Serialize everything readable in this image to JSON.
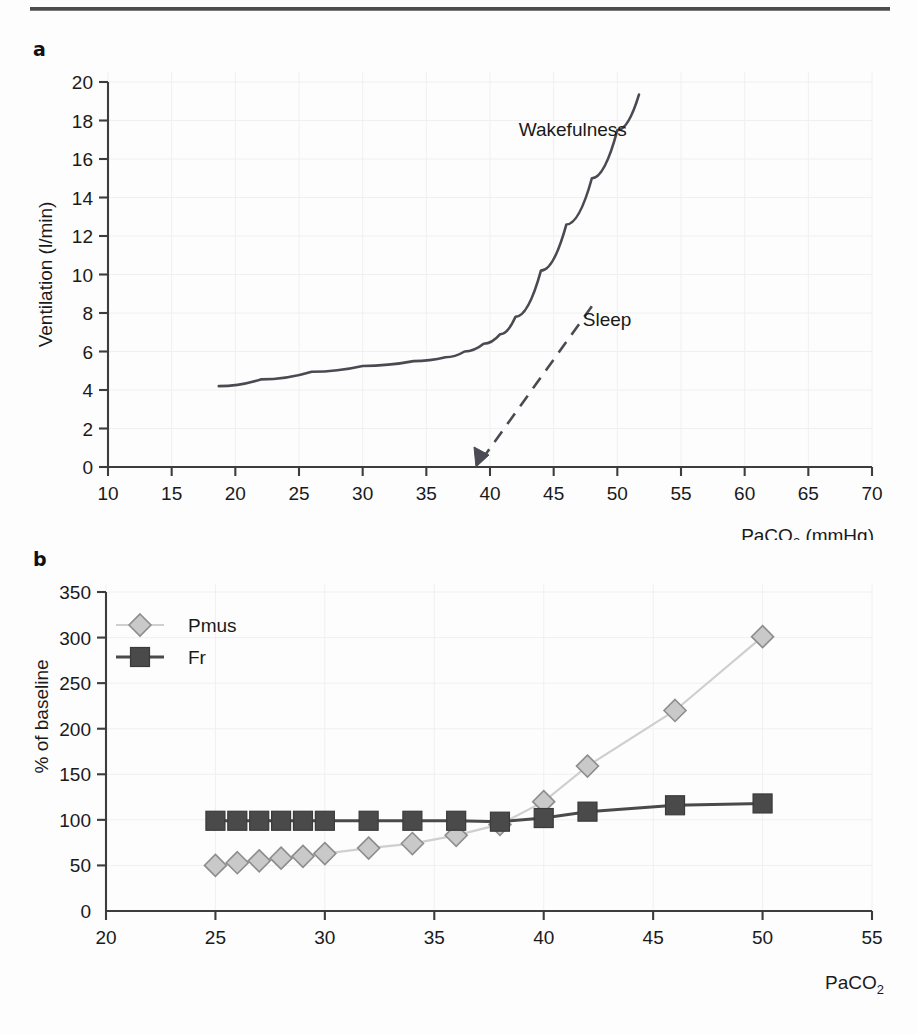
{
  "figure": {
    "panel_a_letter": "a",
    "panel_b_letter": "b"
  },
  "chart_data": [
    {
      "id": "panel_a",
      "type": "line",
      "title": "",
      "xlabel": "PaCO2 (mmHg)",
      "xlabel_main": "PaCO",
      "xlabel_sub": "2",
      "xlabel_unit": " (mmHg)",
      "ylabel": "Ventilation (l/min)",
      "xlim": [
        10,
        70
      ],
      "ylim": [
        0,
        20
      ],
      "xticks": [
        10,
        15,
        20,
        25,
        30,
        35,
        40,
        45,
        50,
        55,
        60,
        65,
        70
      ],
      "yticks": [
        0,
        2,
        4,
        6,
        8,
        10,
        12,
        14,
        16,
        18,
        20
      ],
      "grid": true,
      "legend_position": "inline-annotations",
      "series": [
        {
          "name": "Wakefulness",
          "style": "solid",
          "label_x": 46.5,
          "label_y": 17.2,
          "x": [
            18.7,
            22,
            26,
            30,
            34,
            36.5,
            38,
            39.5,
            40.8,
            42,
            44,
            46,
            48,
            50,
            51.7
          ],
          "y": [
            4.2,
            4.55,
            4.95,
            5.25,
            5.5,
            5.7,
            6.0,
            6.4,
            6.9,
            7.8,
            10.2,
            12.6,
            15.0,
            17.5,
            19.35
          ]
        },
        {
          "name": "Sleep",
          "style": "dashed-with-arrow",
          "label_x": 49.2,
          "label_y": 7.3,
          "x": [
            48.0,
            38.9
          ],
          "y": [
            8.35,
            0.0
          ],
          "arrow_at": {
            "x": 38.9,
            "y": 0.0
          }
        }
      ]
    },
    {
      "id": "panel_b",
      "type": "line",
      "title": "",
      "xlabel": "PaCO2",
      "xlabel_main": "PaCO",
      "xlabel_sub": "2",
      "ylabel": "% of baseline",
      "xlim": [
        20,
        55
      ],
      "ylim": [
        0,
        350
      ],
      "xticks": [
        20,
        25,
        30,
        35,
        40,
        45,
        50,
        55
      ],
      "yticks": [
        0,
        50,
        100,
        150,
        200,
        250,
        300,
        350
      ],
      "grid": true,
      "legend_position": "top-left",
      "series": [
        {
          "name": "Pmus",
          "marker": "diamond",
          "color": "#c9c9c9",
          "x": [
            25,
            26,
            27,
            28,
            29,
            30,
            32,
            34,
            36,
            38,
            40,
            42,
            46,
            50
          ],
          "y": [
            50,
            53,
            55,
            58,
            60,
            63,
            69,
            74,
            83,
            95,
            120,
            159,
            220,
            301
          ]
        },
        {
          "name": "Fr",
          "marker": "square",
          "color": "#4a4a4a",
          "x": [
            25,
            26,
            27,
            28,
            29,
            30,
            32,
            34,
            36,
            38,
            40,
            42,
            46,
            50
          ],
          "y": [
            99,
            99,
            99,
            99,
            99,
            99,
            99,
            99,
            99,
            98,
            102,
            109,
            116,
            118
          ]
        }
      ]
    }
  ],
  "colors": {
    "axis": "#3d3d3d",
    "wakefulness_curve": "#4a4a52",
    "pmus_marker": "#c9c9c9",
    "fr_marker": "#4a4a4a",
    "grid": "#f0f0f2",
    "rule": "#4c4c4c"
  }
}
